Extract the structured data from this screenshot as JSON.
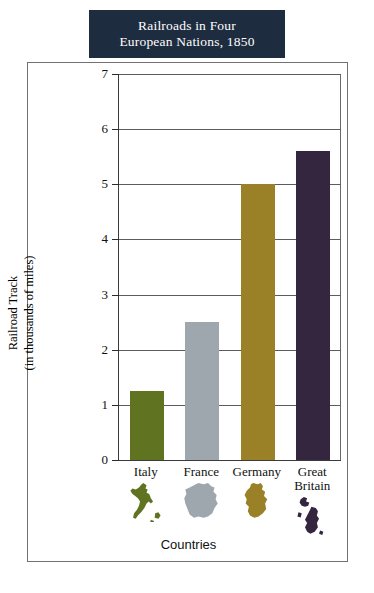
{
  "title": {
    "line1": "Railroads in Four",
    "line2": "European Nations, 1850",
    "banner_color": "#1e2c3f",
    "text_color": "#ffffff"
  },
  "chart_data": {
    "type": "bar",
    "title": "Railroads in Four European Nations, 1850",
    "categories": [
      "Italy",
      "France",
      "Germany",
      "Great Britain"
    ],
    "values": [
      1.25,
      2.5,
      5.0,
      5.6
    ],
    "xlabel": "Countries",
    "ylabel": "Railroad Track (in thousands of miles)",
    "ylim": [
      0,
      7
    ],
    "ytick_labels": [
      "0",
      "1",
      "2",
      "3",
      "4",
      "5",
      "6",
      "7"
    ],
    "ytick_values": [
      0,
      1,
      2,
      3,
      4,
      5,
      6,
      7
    ],
    "grid": true,
    "legend": "none",
    "series_colors": [
      "#5f7320",
      "#9ea7ae",
      "#9a8128",
      "#352640"
    ]
  },
  "axes": {
    "y_title_line1": "Railroad Track",
    "y_title_line2": "(in thousands of miles)",
    "x_title": "Countries"
  },
  "categories": [
    {
      "label": "Italy",
      "value": 1.25,
      "color": "#5f7320",
      "map_icon": "italy-map-icon"
    },
    {
      "label": "France",
      "value": 2.5,
      "color": "#9ea7ae",
      "map_icon": "france-map-icon"
    },
    {
      "label": "Germany",
      "value": 5.0,
      "color": "#9a8128",
      "map_icon": "germany-map-icon"
    },
    {
      "label": "Great\nBritain",
      "value": 5.6,
      "color": "#352640",
      "map_icon": "great-britain-map-icon"
    }
  ]
}
